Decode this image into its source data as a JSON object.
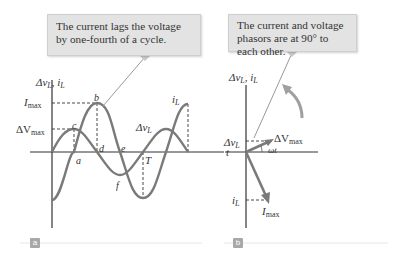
{
  "panel_a": {
    "callout": "The current lags the voltage by one-fourth of a cycle.",
    "y_axis_label": {
      "delta_v": "Δv",
      "v_sub": "L",
      "sep": ", ",
      "i": "i",
      "i_sub": "L"
    },
    "imax_label": {
      "base": "I",
      "sub": "max"
    },
    "dvmax_label": {
      "base": "ΔV",
      "sub": "max"
    },
    "t_label": "t",
    "points": {
      "a": "a",
      "b": "b",
      "c": "c",
      "d": "d",
      "e": "e",
      "f": "f",
      "T": "T"
    },
    "curve_i_label": {
      "base": "i",
      "sub": "L"
    },
    "curve_v_label": {
      "base": "Δv",
      "sub": "L"
    },
    "tag": "a"
  },
  "panel_b": {
    "callout": "The current and voltage phasors are at 90° to each other.",
    "y_axis_label": {
      "delta_v": "Δv",
      "v_sub": "L",
      "sep": ", ",
      "i": "i",
      "i_sub": "L"
    },
    "dv_label": {
      "base": "Δv",
      "sub": "L"
    },
    "dvmax_label": {
      "base": "ΔV",
      "sub": "max"
    },
    "omega_t": "ωt",
    "i_label": {
      "base": "i",
      "sub": "L"
    },
    "imax_label": {
      "base": "I",
      "sub": "max"
    },
    "tag": "b"
  },
  "colors": {
    "curve": "#7a7a7a",
    "axis": "#333333",
    "callout_bg": "#e3e3e3",
    "tag_bg": "#a8a8a8",
    "rule": "#e6e6e6"
  }
}
